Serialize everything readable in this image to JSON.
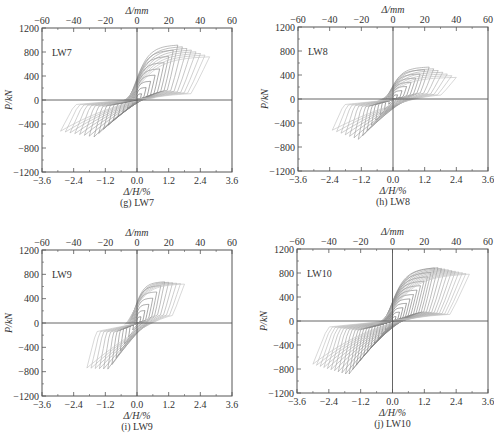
{
  "figure": {
    "footer_caption_faint": "",
    "panels_layout": "2x2"
  },
  "chart_data": [
    {
      "type": "line",
      "id": "g",
      "specimen": "LW7",
      "caption": "(g) LW7",
      "title": "",
      "xlabel": "Δ/H/%",
      "xlabel_top": "Δ/mm",
      "ylabel": "P/kN",
      "xlim": [
        -3.6,
        3.6
      ],
      "xlim_top": [
        -60,
        60
      ],
      "ylim": [
        -1200,
        1200
      ],
      "xticks": [
        "-3.6",
        "-2.4",
        "-1.2",
        "0.0",
        "1.2",
        "2.4",
        "3.6"
      ],
      "xticks_top": [
        "-60",
        "-40",
        "-20",
        "0",
        "20",
        "40",
        "60"
      ],
      "yticks": [
        "1200",
        "800",
        "400",
        "0",
        "-400",
        "-800",
        "-1200"
      ],
      "grid": false,
      "series_description": "hysteresis loops, load P vs drift ratio",
      "loop_count": 16,
      "max_drift_pos": 2.75,
      "max_drift_neg": -2.9,
      "peak_load_pos": 920,
      "peak_load_neg": -620,
      "end_load_pos": 720,
      "end_load_neg": -520,
      "pinching": 0.55
    },
    {
      "type": "line",
      "id": "h",
      "specimen": "LW8",
      "caption": "(h) LW8",
      "title": "",
      "xlabel": "Δ/H/%",
      "xlabel_top": "Δ/mm",
      "ylabel": "P/kN",
      "xlim": [
        -3.6,
        3.6
      ],
      "xlim_top": [
        -60,
        60
      ],
      "ylim": [
        -1200,
        1200
      ],
      "xticks": [
        "-3.6",
        "-2.4",
        "-1.2",
        "0.0",
        "1.2",
        "2.4",
        "3.6"
      ],
      "xticks_top": [
        "-60",
        "-40",
        "-20",
        "0",
        "20",
        "40",
        "60"
      ],
      "yticks": [
        "1200",
        "800",
        "400",
        "0",
        "-400",
        "-800",
        "-1200"
      ],
      "grid": false,
      "series_description": "hysteresis loops, load P vs drift ratio",
      "loop_count": 14,
      "max_drift_pos": 2.4,
      "max_drift_neg": -2.3,
      "peak_load_pos": 540,
      "peak_load_neg": -680,
      "end_load_pos": 360,
      "end_load_neg": -520,
      "pinching": 0.3
    },
    {
      "type": "line",
      "id": "i",
      "specimen": "LW9",
      "caption": "(i) LW9",
      "title": "",
      "xlabel": "Δ/H/%",
      "xlabel_top": "Δ/mm",
      "ylabel": "P/kN",
      "xlim": [
        -3.6,
        3.6
      ],
      "xlim_top": [
        -60,
        60
      ],
      "ylim": [
        -1200,
        1200
      ],
      "xticks": [
        "-3.6",
        "-2.4",
        "-1.2",
        "0.0",
        "1.2",
        "2.4",
        "3.6"
      ],
      "xticks_top": [
        "-60",
        "-40",
        "-20",
        "0",
        "20",
        "40",
        "60"
      ],
      "yticks": [
        "1200",
        "800",
        "400",
        "0",
        "-400",
        "-800",
        "-1200"
      ],
      "grid": false,
      "series_description": "hysteresis loops, load P vs drift ratio",
      "loop_count": 12,
      "max_drift_pos": 1.8,
      "max_drift_neg": -1.9,
      "peak_load_pos": 680,
      "peak_load_neg": -760,
      "end_load_pos": 640,
      "end_load_neg": -740,
      "pinching": 0.2
    },
    {
      "type": "line",
      "id": "j",
      "specimen": "LW10",
      "caption": "(j) LW10",
      "title": "",
      "xlabel": "Δ/H/%",
      "xlabel_top": "Δ/mm",
      "ylabel": "P/kN",
      "xlim": [
        -3.6,
        3.6
      ],
      "xlim_top": [
        -60,
        60
      ],
      "ylim": [
        -1200,
        1200
      ],
      "xticks": [
        "-3.6",
        "-2.4",
        "-1.2",
        "0.0",
        "1.2",
        "2.4",
        "3.6"
      ],
      "xticks_top": [
        "-60",
        "-40",
        "-20",
        "0",
        "20",
        "40",
        "60"
      ],
      "yticks": [
        "1200",
        "800",
        "400",
        "0",
        "-400",
        "-800",
        "-1200"
      ],
      "grid": false,
      "series_description": "hysteresis loops, load P vs drift ratio",
      "loop_count": 22,
      "max_drift_pos": 2.9,
      "max_drift_neg": -3.0,
      "peak_load_pos": 900,
      "peak_load_neg": -900,
      "end_load_pos": 780,
      "end_load_neg": -720,
      "pinching": 0.6
    }
  ],
  "panel_frames": [
    {
      "x": 42,
      "y": 28,
      "w": 190,
      "h": 144
    },
    {
      "x": 298,
      "y": 27,
      "w": 190,
      "h": 144
    },
    {
      "x": 42,
      "y": 250,
      "w": 190,
      "h": 146
    },
    {
      "x": 297,
      "y": 249,
      "w": 191,
      "h": 144
    }
  ],
  "colors": {
    "frame": "#555555",
    "loop_dark": "#555555",
    "loop_light": "#b0b0b0",
    "text": "#333333"
  }
}
